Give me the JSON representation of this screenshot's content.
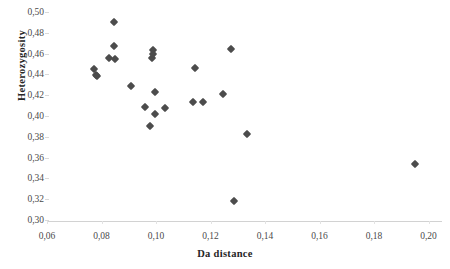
{
  "chart_data": {
    "type": "scatter",
    "title": "",
    "xlabel": "Da distance",
    "ylabel": "Heterozygosity",
    "xlim": [
      0.06,
      0.2
    ],
    "ylim": [
      0.3,
      0.5
    ],
    "grid": false,
    "legend": null,
    "decimal_separator": ",",
    "marker": "diamond",
    "marker_color": "#4c4c4c",
    "xticks": [
      "0,06",
      "0,08",
      "0,10",
      "0,12",
      "0,14",
      "0,16",
      "0,18",
      "0,20"
    ],
    "xtick_values": [
      0.06,
      0.08,
      0.1,
      0.12,
      0.14,
      0.16,
      0.18,
      0.2
    ],
    "yticks": [
      "0,30",
      "0,32",
      "0,34",
      "0,36",
      "0,38",
      "0,40",
      "0,42",
      "0,44",
      "0,46",
      "0,48",
      "0,50"
    ],
    "ytick_values": [
      0.3,
      0.32,
      0.34,
      0.36,
      0.38,
      0.4,
      0.42,
      0.44,
      0.46,
      0.48,
      0.5
    ],
    "points": [
      {
        "x": 0.0772,
        "y": 0.445
      },
      {
        "x": 0.0778,
        "y": 0.4395
      },
      {
        "x": 0.0782,
        "y": 0.438
      },
      {
        "x": 0.0827,
        "y": 0.456
      },
      {
        "x": 0.0845,
        "y": 0.49
      },
      {
        "x": 0.0845,
        "y": 0.467
      },
      {
        "x": 0.085,
        "y": 0.455
      },
      {
        "x": 0.0908,
        "y": 0.429
      },
      {
        "x": 0.096,
        "y": 0.409
      },
      {
        "x": 0.0978,
        "y": 0.39
      },
      {
        "x": 0.0985,
        "y": 0.456
      },
      {
        "x": 0.099,
        "y": 0.463
      },
      {
        "x": 0.099,
        "y": 0.46
      },
      {
        "x": 0.0996,
        "y": 0.402
      },
      {
        "x": 0.0997,
        "y": 0.423
      },
      {
        "x": 0.1033,
        "y": 0.408
      },
      {
        "x": 0.1135,
        "y": 0.4135
      },
      {
        "x": 0.1144,
        "y": 0.4465
      },
      {
        "x": 0.1174,
        "y": 0.413
      },
      {
        "x": 0.1245,
        "y": 0.421
      },
      {
        "x": 0.1277,
        "y": 0.464
      },
      {
        "x": 0.1285,
        "y": 0.3185
      },
      {
        "x": 0.1335,
        "y": 0.3825
      },
      {
        "x": 0.195,
        "y": 0.354
      }
    ]
  }
}
